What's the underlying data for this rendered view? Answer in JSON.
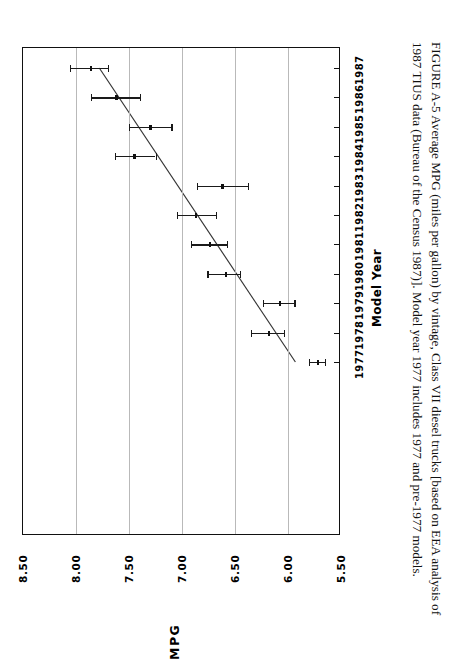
{
  "figure": {
    "caption": "FIGURE A-5  Average MPG (miles per gallon) by vintage, Class VII diesel trucks [based on EEA analysis of 1987 TIUS data (Bureau of the Census 1987)]. Model year 1977 includes 1977 and pre-1977 models.",
    "orientation": "rotated-90-landscape-on-portrait-page"
  },
  "chart_data": {
    "type": "scatter",
    "title": "",
    "xlabel": "Model Year",
    "ylabel": "MPG",
    "ylabel_chars": [
      "M",
      "P",
      "G"
    ],
    "categories": [
      "1977",
      "1978",
      "1979",
      "1980",
      "1981",
      "1982",
      "1983",
      "1984",
      "1985",
      "1986",
      "1987"
    ],
    "x": [
      1977,
      1978,
      1979,
      1980,
      1981,
      1982,
      1983,
      1984,
      1985,
      1986,
      1987
    ],
    "values": [
      5.72,
      6.18,
      6.08,
      6.59,
      6.74,
      6.87,
      6.62,
      7.45,
      7.3,
      7.62,
      7.86
    ],
    "error_low": [
      5.65,
      6.04,
      5.94,
      6.45,
      6.58,
      6.68,
      6.38,
      7.25,
      7.1,
      7.4,
      7.7
    ],
    "error_high": [
      5.8,
      6.35,
      6.24,
      6.76,
      6.92,
      7.05,
      6.86,
      7.63,
      7.5,
      7.86,
      8.06
    ],
    "ytick_labels": [
      "8.50",
      "8.00",
      "7.50",
      "7.00",
      "6.50",
      "6.00",
      "5.50"
    ],
    "yticks": [
      8.5,
      8.0,
      7.5,
      7.0,
      6.5,
      6.0,
      5.5
    ],
    "ylim": [
      5.5,
      8.5
    ],
    "xlim": [
      1976.5,
      1987.5
    ],
    "grid": "value-axis-only",
    "legend": "none",
    "fit_line": {
      "type": "linear-trend",
      "start": {
        "year": 1977,
        "mpg": 5.93
      },
      "end": {
        "year": 1987,
        "mpg": 7.78
      }
    },
    "marker_style": "point-with-horizontal-error-bar",
    "colors": {
      "axis": "#111111",
      "grid": "#b9b9b9",
      "data": "#1a1a1a",
      "fit_line": "#333333",
      "background": "#ffffff"
    }
  }
}
